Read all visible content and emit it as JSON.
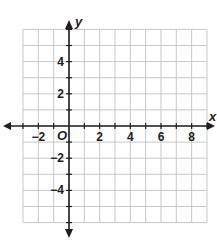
{
  "chart_data": {
    "type": "coordinate-grid",
    "title": "",
    "xlabel": "x",
    "ylabel": "y",
    "origin_label": "O",
    "xlim": [
      -3,
      9
    ],
    "ylim": [
      -6,
      6
    ],
    "grid": true,
    "x_tick_labels": [
      "−2",
      "2",
      "4",
      "6",
      "8"
    ],
    "x_tick_values": [
      -2,
      2,
      4,
      6,
      8
    ],
    "y_tick_labels": [
      "4",
      "2",
      "−2",
      "−4"
    ],
    "y_tick_values": [
      4,
      2,
      -2,
      -4
    ],
    "series": []
  },
  "colors": {
    "grid": "#c8c8c8",
    "axis": "#231f20",
    "background": "#ffffff"
  }
}
